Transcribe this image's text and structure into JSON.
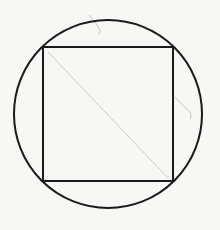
{
  "diagram": {
    "type": "geometry",
    "background": "#f7f7f5",
    "stroke_color": "#1a1a1a",
    "pencil_color": "#b5b5b5",
    "circle": {
      "cx": 108,
      "cy": 114,
      "r": 94
    },
    "square": {
      "x": 43,
      "y": 47,
      "width": 130,
      "height": 134
    },
    "diagonal": {
      "x1": 48,
      "y1": 52,
      "x2": 168,
      "y2": 178
    },
    "pencil_marks": [
      {
        "d": "M89 15 Q96 22 100 30 Q101 33 98 34"
      },
      {
        "d": "M175 97 Q183 106 190 112 Q192 116 190 119"
      }
    ]
  }
}
